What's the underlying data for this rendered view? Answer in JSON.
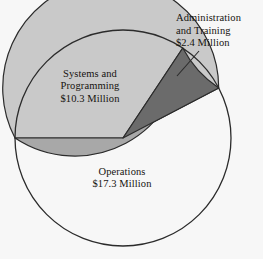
{
  "chart_data": {
    "type": "pie",
    "title": "",
    "subtitle": "",
    "xlabel": "",
    "ylabel": "",
    "legend_position": "none",
    "grid": false,
    "units": "Million USD",
    "total": 30.0,
    "categories": [
      "Operations",
      "Systems and Programming",
      "Administration and Training"
    ],
    "values": [
      17.3,
      10.3,
      2.4
    ],
    "labels": [
      "Operations\n$17.3 Million",
      "Systems and\nProgramming\n$10.3 Million",
      "Administration\nand Training\n$2.4 Million"
    ],
    "colors": [
      "#c9c9c9",
      "#a8a8a8",
      "#6b6b6b"
    ],
    "percentages": [
      57.7,
      34.3,
      8.0
    ],
    "slices": [
      {
        "name": "Operations",
        "value": 17.3,
        "value_text": "$17.3 Million",
        "label_text": "Operations",
        "color": "#c9c9c9",
        "start_angle": 180,
        "end_angle": 387.6
      },
      {
        "name": "Systems and Programming",
        "value": 10.3,
        "value_text": "$10.3 Million",
        "label_text": "Systems and Programming",
        "color": "#a8a8a8",
        "start_angle": 56.4,
        "end_angle": 180
      },
      {
        "name": "Administration and Training",
        "value": 2.4,
        "value_text": "$2.4 Million",
        "label_text": "Administration and Training",
        "color": "#6b6b6b",
        "start_angle": 27.6,
        "end_angle": 56.4
      }
    ]
  },
  "chart": {
    "background_color": "#f7f7f7",
    "outline_color": "#2b2b2b",
    "center_x": 123,
    "center_y": 138,
    "radius": 108,
    "leader_line": {
      "from_x": 177,
      "from_y": 76,
      "to_x": 199,
      "to_y": 51
    }
  },
  "labels": {
    "operations": "Operations\n$17.3 Million",
    "systems": "Systems and\nProgramming\n$10.3 Million",
    "administration": "Administration\nand Training\n$2.4 Million"
  }
}
